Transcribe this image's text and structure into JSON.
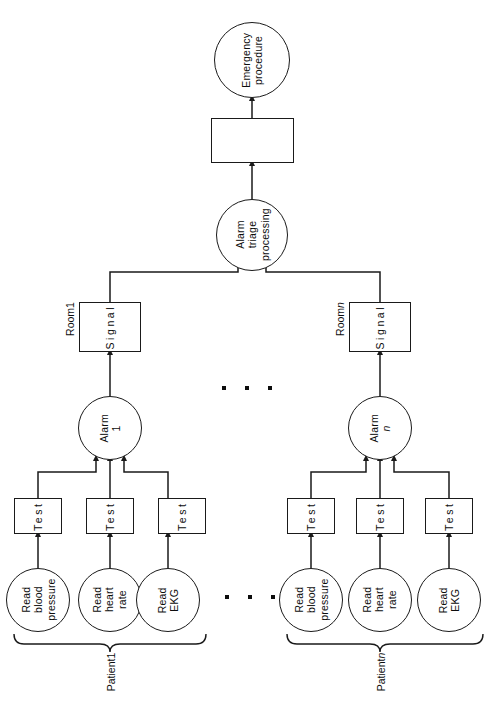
{
  "diagram": {
    "stroke_color": "#1a1a1a",
    "text_color": "#0d0d0d",
    "background": "#ffffff"
  },
  "top": {
    "emergency_procedure": "Emergency\nprocedure",
    "emergency_procedure_line1": "Emergency",
    "emergency_procedure_line2": "procedure",
    "unlabeled_box": "",
    "alarm_triage_line1": "Alarm",
    "alarm_triage_line2": "triage",
    "alarm_triage_line3": "processing"
  },
  "rooms": [
    {
      "caption_prefix": "Room ",
      "caption_index": "1",
      "caption_italic": false,
      "signal_label": "Signal",
      "alarm_line1": "Alarm",
      "alarm_index": "1",
      "alarm_index_italic": false
    },
    {
      "caption_prefix": "Room ",
      "caption_index": "n",
      "caption_italic": true,
      "signal_label": "Signal",
      "alarm_line1": "Alarm",
      "alarm_index": "n",
      "alarm_index_italic": true
    }
  ],
  "patients": [
    {
      "caption_prefix": "Patient ",
      "caption_index": "1",
      "caption_italic": false,
      "tests": [
        "Test",
        "Test",
        "Test"
      ],
      "reads": [
        {
          "line1": "Read",
          "line2": "blood",
          "line3": "pressure"
        },
        {
          "line1": "Read",
          "line2": "heart",
          "line3": "rate"
        },
        {
          "line1": "Read",
          "line2": "EKG",
          "line3": ""
        }
      ]
    },
    {
      "caption_prefix": "Patient ",
      "caption_index": "n",
      "caption_italic": true,
      "tests": [
        "Test",
        "Test",
        "Test"
      ],
      "reads": [
        {
          "line1": "Read",
          "line2": "blood",
          "line3": "pressure"
        },
        {
          "line1": "Read",
          "line2": "heart",
          "line3": "rate"
        },
        {
          "line1": "Read",
          "line2": "EKG",
          "line3": ""
        }
      ]
    }
  ],
  "ellipses": {
    "alarm_level": "• • •",
    "read_level": "• • •",
    "dot_count": 3
  }
}
